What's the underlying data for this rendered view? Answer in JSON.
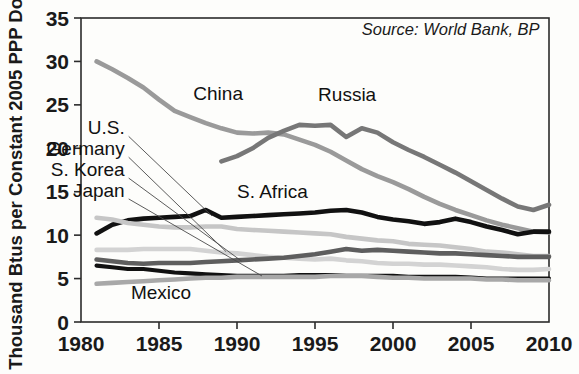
{
  "chart_data": {
    "type": "line",
    "title": "",
    "xlabel": "",
    "ylabel": "Thousand Btus per Constant 2005 PPP Dollar",
    "xlim": [
      1980,
      2010
    ],
    "ylim": [
      0,
      35
    ],
    "xticks": [
      "1980",
      "1985",
      "1990",
      "1995",
      "2000",
      "2005",
      "2010"
    ],
    "yticks": [
      "0",
      "5",
      "10",
      "15",
      "20",
      "25",
      "30",
      "35"
    ],
    "grid": false,
    "legend_position": "inline-labels",
    "annotations": [
      {
        "text": "Source: World Bank, BP",
        "x": 2009.4,
        "y": 33.0,
        "anchor": "end",
        "style": "italic"
      }
    ],
    "series": [
      {
        "name": "China",
        "color": "#9a9a9a",
        "width": 4.6,
        "label": "China",
        "label_x": 1987.2,
        "label_y": 25.6,
        "x": [
          1981,
          1982,
          1983,
          1984,
          1985,
          1986,
          1987,
          1988,
          1989,
          1990,
          1991,
          1992,
          1993,
          1994,
          1995,
          1996,
          1997,
          1998,
          1999,
          2000,
          2001,
          2002,
          2003,
          2004,
          2005,
          2006,
          2007,
          2008,
          2009,
          2010
        ],
        "y": [
          30.0,
          29.1,
          28.1,
          27.0,
          25.6,
          24.3,
          23.6,
          22.9,
          22.3,
          21.8,
          21.7,
          21.8,
          21.6,
          21.0,
          20.4,
          19.6,
          18.6,
          17.6,
          16.8,
          16.1,
          15.3,
          14.4,
          13.6,
          12.9,
          12.3,
          11.7,
          11.2,
          10.8,
          10.4,
          10.3
        ]
      },
      {
        "name": "Russia",
        "color": "#777777",
        "width": 4.6,
        "label": "Russia",
        "label_x": 1995.2,
        "label_y": 25.4,
        "x": [
          1989,
          1990,
          1991,
          1992,
          1993,
          1994,
          1995,
          1996,
          1997,
          1998,
          1999,
          2000,
          2001,
          2002,
          2003,
          2004,
          2005,
          2006,
          2007,
          2008,
          2009,
          2010
        ],
        "y": [
          18.5,
          19.1,
          20.0,
          21.2,
          22.0,
          22.7,
          22.6,
          22.7,
          21.3,
          22.3,
          21.8,
          20.7,
          19.8,
          19.0,
          18.1,
          17.2,
          16.2,
          15.2,
          14.2,
          13.3,
          12.9,
          13.5
        ]
      },
      {
        "name": "S. Africa",
        "color": "#111111",
        "width": 4.6,
        "label": "S. Africa",
        "label_x": 1990.0,
        "label_y": 14.3,
        "x": [
          1981,
          1982,
          1983,
          1984,
          1985,
          1986,
          1987,
          1988,
          1989,
          1990,
          1991,
          1992,
          1993,
          1994,
          1995,
          1996,
          1997,
          1998,
          1999,
          2000,
          2001,
          2002,
          2003,
          2004,
          2005,
          2006,
          2007,
          2008,
          2009,
          2010
        ],
        "y": [
          10.2,
          11.2,
          11.7,
          11.9,
          12.0,
          12.1,
          12.2,
          12.9,
          12.0,
          12.1,
          12.2,
          12.3,
          12.4,
          12.5,
          12.6,
          12.8,
          12.9,
          12.6,
          12.1,
          11.8,
          11.6,
          11.3,
          11.5,
          11.9,
          11.5,
          11.0,
          10.6,
          10.1,
          10.4,
          10.4
        ]
      },
      {
        "name": "U.S.",
        "color": "#c6c6c6",
        "width": 4.6,
        "label": "U.S.",
        "label_x": 1982.8,
        "label_y": 21.6,
        "label_anchor": "end",
        "leader_to_x": 1988.4,
        "leader_to_y": 12.2,
        "x": [
          1981,
          1982,
          1983,
          1984,
          1985,
          1986,
          1987,
          1988,
          1989,
          1990,
          1991,
          1992,
          1993,
          1994,
          1995,
          1996,
          1997,
          1998,
          1999,
          2000,
          2001,
          2002,
          2003,
          2004,
          2005,
          2006,
          2007,
          2008,
          2009,
          2010
        ],
        "y": [
          12.0,
          11.8,
          11.4,
          11.2,
          11.0,
          10.9,
          10.9,
          11.0,
          11.0,
          10.7,
          10.6,
          10.5,
          10.4,
          10.3,
          10.2,
          10.1,
          9.8,
          9.6,
          9.4,
          9.3,
          9.0,
          8.9,
          8.8,
          8.6,
          8.4,
          8.1,
          8.0,
          7.8,
          7.6,
          7.6
        ]
      },
      {
        "name": "Germany",
        "color": "#d3d3d3",
        "width": 4.6,
        "label": "Germany",
        "label_x": 1982.8,
        "label_y": 19.2,
        "label_anchor": "end",
        "leader_to_x": 1989.3,
        "leader_to_y": 8.1,
        "x": [
          1981,
          1982,
          1983,
          1984,
          1985,
          1986,
          1987,
          1988,
          1989,
          1990,
          1991,
          1992,
          1993,
          1994,
          1995,
          1996,
          1997,
          1998,
          1999,
          2000,
          2001,
          2002,
          2003,
          2004,
          2005,
          2006,
          2007,
          2008,
          2009,
          2010
        ],
        "y": [
          8.3,
          8.3,
          8.3,
          8.4,
          8.4,
          8.4,
          8.4,
          8.2,
          8.0,
          7.9,
          7.7,
          7.5,
          7.4,
          7.3,
          7.2,
          7.3,
          7.1,
          7.0,
          6.8,
          6.7,
          6.7,
          6.6,
          6.6,
          6.5,
          6.4,
          6.3,
          6.1,
          6.0,
          6.0,
          6.1
        ]
      },
      {
        "name": "S. Korea",
        "color": "#5e5e5e",
        "width": 4.6,
        "label": "S. Korea",
        "label_x": 1982.8,
        "label_y": 16.8,
        "label_anchor": "end",
        "leader_to_x": 1990.3,
        "leader_to_y": 7.0,
        "x": [
          1981,
          1982,
          1983,
          1984,
          1985,
          1986,
          1987,
          1988,
          1989,
          1990,
          1991,
          1992,
          1993,
          1994,
          1995,
          1996,
          1997,
          1998,
          1999,
          2000,
          2001,
          2002,
          2003,
          2004,
          2005,
          2006,
          2007,
          2008,
          2009,
          2010
        ],
        "y": [
          7.2,
          7.0,
          6.8,
          6.7,
          6.8,
          6.8,
          6.8,
          6.9,
          7.0,
          7.1,
          7.2,
          7.3,
          7.4,
          7.6,
          7.8,
          8.1,
          8.4,
          8.2,
          8.3,
          8.2,
          8.1,
          8.0,
          7.9,
          7.9,
          7.8,
          7.7,
          7.6,
          7.5,
          7.5,
          7.5
        ]
      },
      {
        "name": "Japan",
        "color": "#111111",
        "width": 4.2,
        "label": "Japan",
        "label_x": 1982.8,
        "label_y": 14.4,
        "label_anchor": "end",
        "leader_to_x": 1991.6,
        "leader_to_y": 5.3,
        "x": [
          1981,
          1982,
          1983,
          1984,
          1985,
          1986,
          1987,
          1988,
          1989,
          1990,
          1991,
          1992,
          1993,
          1994,
          1995,
          1996,
          1997,
          1998,
          1999,
          2000,
          2001,
          2002,
          2003,
          2004,
          2005,
          2006,
          2007,
          2008,
          2009,
          2010
        ],
        "y": [
          6.5,
          6.3,
          6.1,
          6.1,
          5.9,
          5.7,
          5.6,
          5.5,
          5.4,
          5.3,
          5.3,
          5.3,
          5.3,
          5.4,
          5.4,
          5.4,
          5.3,
          5.3,
          5.3,
          5.3,
          5.2,
          5.2,
          5.2,
          5.2,
          5.1,
          5.0,
          5.0,
          5.0,
          5.0,
          5.0
        ]
      },
      {
        "name": "Mexico",
        "color": "#a8a8a8",
        "width": 4.6,
        "label": "Mexico",
        "label_x": 1983.2,
        "label_y": 2.6,
        "x": [
          1981,
          1982,
          1983,
          1984,
          1985,
          1986,
          1987,
          1988,
          1989,
          1990,
          1991,
          1992,
          1993,
          1994,
          1995,
          1996,
          1997,
          1998,
          1999,
          2000,
          2001,
          2002,
          2003,
          2004,
          2005,
          2006,
          2007,
          2008,
          2009,
          2010
        ],
        "y": [
          4.4,
          4.5,
          4.6,
          4.7,
          4.8,
          4.9,
          5.0,
          5.1,
          5.1,
          5.2,
          5.2,
          5.2,
          5.2,
          5.2,
          5.2,
          5.3,
          5.3,
          5.3,
          5.2,
          5.1,
          5.1,
          5.0,
          5.0,
          5.0,
          5.0,
          4.9,
          4.9,
          4.8,
          4.8,
          4.8
        ]
      }
    ]
  }
}
